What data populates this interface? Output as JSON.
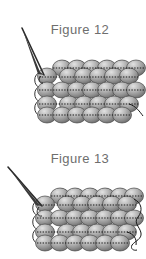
{
  "page": {
    "background_color": "#ffffff",
    "width": 146,
    "height": 259
  },
  "figures": [
    {
      "caption": "Figure 12",
      "diagram_name": "peyote-stitch-beadwork-diagram",
      "needle": {
        "name": "beading-needle",
        "description": "thin needle entering from upper left",
        "color": "#2b2b2b"
      },
      "thread": {
        "name": "beading-thread",
        "color": "#1f1f1f"
      },
      "bead_grid": {
        "rows": 4,
        "columns": 6,
        "bead_color_light": "#d8d8d8",
        "bead_color_mid": "#a8a8a8",
        "bead_color_dark": "#6d6d6d",
        "bead_outline": "#4a4a4a",
        "hole_marking": "dotted"
      }
    },
    {
      "caption": "Figure 13",
      "diagram_name": "peyote-stitch-beadwork-diagram",
      "needle": {
        "name": "beading-needle",
        "description": "thin needle entering from upper left",
        "color": "#2b2b2b"
      },
      "thread": {
        "name": "beading-thread",
        "color": "#1f1f1f",
        "detail": "looping thread at right edge"
      },
      "bead_grid": {
        "rows": 4,
        "columns": 6,
        "bead_color_light": "#d8d8d8",
        "bead_color_mid": "#a8a8a8",
        "bead_color_dark": "#6d6d6d",
        "bead_outline": "#4a4a4a",
        "hole_marking": "dotted"
      }
    }
  ]
}
